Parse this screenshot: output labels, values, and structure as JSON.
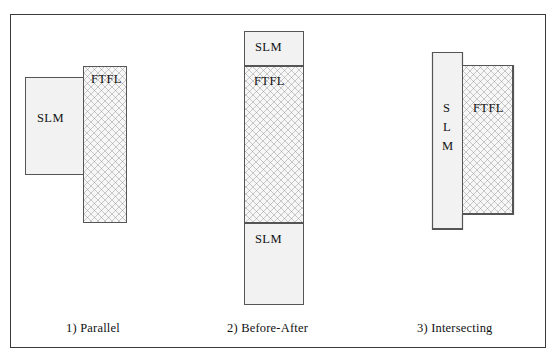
{
  "figure": {
    "panels": [
      {
        "id": "parallel",
        "caption": "1) Parallel",
        "shapes": [
          {
            "name": "slm-box",
            "label": "SLM",
            "fill": "plain",
            "x": 24,
            "y": 76,
            "w": 59,
            "h": 98
          },
          {
            "name": "ftfl-box",
            "label": "FTFL",
            "fill": "hatched",
            "x": 82,
            "y": 65,
            "w": 44,
            "h": 157
          }
        ]
      },
      {
        "id": "before-after",
        "caption": "2) Before-After",
        "shapes": [
          {
            "name": "slm-box-top",
            "label": "SLM",
            "fill": "plain",
            "x": 243,
            "y": 30,
            "w": 60,
            "h": 35
          },
          {
            "name": "ftfl-box",
            "label": "FTFL",
            "fill": "hatched",
            "x": 243,
            "y": 65,
            "w": 60,
            "h": 157
          },
          {
            "name": "slm-box-bottom",
            "label": "SLM",
            "fill": "plain",
            "x": 243,
            "y": 222,
            "w": 60,
            "h": 82
          }
        ]
      },
      {
        "id": "intersecting",
        "caption": "3) Intersecting",
        "shapes": [
          {
            "name": "slm-box",
            "label": "S\nL\nM",
            "fill": "plain",
            "x": 431,
            "y": 51,
            "w": 30,
            "h": 177
          },
          {
            "name": "ftfl-box",
            "label": "FTFL",
            "fill": "hatched",
            "x": 461,
            "y": 64,
            "w": 51,
            "h": 149
          }
        ]
      }
    ],
    "captions": {
      "panel_1": "1) Parallel",
      "panel_2": "2) Before-After",
      "panel_3": "3) Intersecting"
    },
    "labels": {
      "slm": "SLM",
      "ftfl": "FTFL",
      "slm_vertical_s": "S",
      "slm_vertical_l": "L",
      "slm_vertical_m": "M"
    },
    "colors": {
      "frame_border": "#3a3a3a",
      "shape_border": "#555555",
      "plain_fill": "#f2f2f2",
      "hatched_fill": "#f7f7f7",
      "hatch_line": "#787878",
      "text": "#111111",
      "background": "#ffffff"
    }
  }
}
